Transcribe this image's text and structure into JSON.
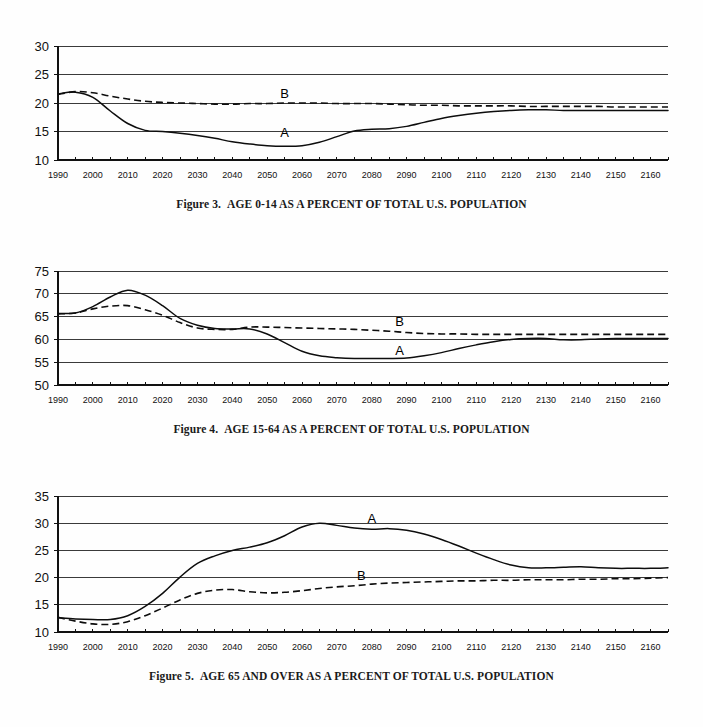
{
  "document": {
    "kind": "figure-page",
    "background_color": "#fefefe",
    "ink_color": "#0d0d0d"
  },
  "figures": [
    {
      "id": "figure-3",
      "caption_number": "Figure 3.",
      "caption_text": "AGE 0-14 AS A PERCENT OF TOTAL U.S. POPULATION",
      "series_labels": [
        {
          "name": "A",
          "x": 2055,
          "y": 14.1
        },
        {
          "name": "B",
          "x": 2055,
          "y": 20.9
        }
      ]
    },
    {
      "id": "figure-4",
      "caption_number": "Figure 4.",
      "caption_text": "AGE 15-64 AS A PERCENT OF TOTAL U.S. POPULATION",
      "series_labels": [
        {
          "name": "A",
          "x": 2088,
          "y": 56.6
        },
        {
          "name": "B",
          "x": 2088,
          "y": 62.9
        }
      ]
    },
    {
      "id": "figure-5",
      "caption_number": "Figure 5.",
      "caption_text": "AGE 65 AND OVER AS A PERCENT OF TOTAL U.S. POPULATION",
      "series_labels": [
        {
          "name": "A",
          "x": 2080,
          "y": 30.0
        },
        {
          "name": "B",
          "x": 2077,
          "y": 19.6
        }
      ]
    }
  ],
  "chart_data": [
    {
      "type": "line",
      "title": "Figure 3.  AGE 0-14 AS A PERCENT OF TOTAL U.S. POPULATION",
      "xlabel": "",
      "ylabel": "",
      "xlim": [
        1990,
        2165
      ],
      "ylim": [
        10,
        30
      ],
      "yticks": [
        10,
        15,
        20,
        25,
        30
      ],
      "xticks": [
        1990,
        2000,
        2010,
        2020,
        2030,
        2040,
        2050,
        2060,
        2070,
        2080,
        2090,
        2100,
        2110,
        2120,
        2130,
        2140,
        2150,
        2160
      ],
      "xtick_minor_step": 5,
      "grid": true,
      "legend": "inline-labels",
      "series": [
        {
          "name": "A",
          "style": "solid",
          "x": [
            1990,
            1995,
            2000,
            2005,
            2010,
            2015,
            2020,
            2025,
            2030,
            2035,
            2040,
            2045,
            2050,
            2055,
            2060,
            2065,
            2070,
            2075,
            2080,
            2085,
            2090,
            2095,
            2100,
            2105,
            2110,
            2115,
            2120,
            2125,
            2130,
            2135,
            2140,
            2145,
            2150,
            2155,
            2160,
            2165
          ],
          "values": [
            21.6,
            21.9,
            21.0,
            18.6,
            16.4,
            15.2,
            15.0,
            14.7,
            14.3,
            13.8,
            13.2,
            12.8,
            12.5,
            12.4,
            12.5,
            13.1,
            14.1,
            15.1,
            15.4,
            15.5,
            15.9,
            16.6,
            17.3,
            17.8,
            18.2,
            18.5,
            18.7,
            18.8,
            18.8,
            18.7,
            18.7,
            18.7,
            18.7,
            18.7,
            18.7,
            18.7
          ]
        },
        {
          "name": "B",
          "style": "dashed",
          "x": [
            1990,
            1995,
            2000,
            2005,
            2010,
            2015,
            2020,
            2025,
            2030,
            2035,
            2040,
            2045,
            2050,
            2055,
            2060,
            2065,
            2070,
            2075,
            2080,
            2085,
            2090,
            2095,
            2100,
            2105,
            2110,
            2115,
            2120,
            2125,
            2130,
            2135,
            2140,
            2145,
            2150,
            2155,
            2160,
            2165
          ],
          "values": [
            21.5,
            22.0,
            21.8,
            21.2,
            20.7,
            20.3,
            20.1,
            20.0,
            19.9,
            19.8,
            19.8,
            19.9,
            19.9,
            20.0,
            20.0,
            20.0,
            19.9,
            19.9,
            19.9,
            19.8,
            19.7,
            19.6,
            19.6,
            19.5,
            19.5,
            19.5,
            19.5,
            19.4,
            19.4,
            19.4,
            19.4,
            19.4,
            19.3,
            19.3,
            19.3,
            19.3
          ]
        }
      ]
    },
    {
      "type": "line",
      "title": "Figure 4.  AGE 15-64 AS A PERCENT OF TOTAL U.S. POPULATION",
      "xlabel": "",
      "ylabel": "",
      "xlim": [
        1990,
        2165
      ],
      "ylim": [
        50,
        75
      ],
      "yticks": [
        50,
        55,
        60,
        65,
        70,
        75
      ],
      "xticks": [
        1990,
        2000,
        2010,
        2020,
        2030,
        2040,
        2050,
        2060,
        2070,
        2080,
        2090,
        2100,
        2110,
        2120,
        2130,
        2140,
        2150,
        2160
      ],
      "xtick_minor_step": 5,
      "grid": true,
      "legend": "inline-labels",
      "series": [
        {
          "name": "A",
          "style": "solid",
          "x": [
            1990,
            1995,
            2000,
            2005,
            2010,
            2015,
            2020,
            2025,
            2030,
            2035,
            2040,
            2045,
            2050,
            2055,
            2060,
            2065,
            2070,
            2075,
            2080,
            2085,
            2090,
            2095,
            2100,
            2105,
            2110,
            2115,
            2120,
            2125,
            2130,
            2135,
            2140,
            2145,
            2150,
            2155,
            2160,
            2165
          ],
          "values": [
            65.7,
            65.8,
            67.2,
            69.3,
            70.8,
            69.7,
            67.4,
            64.6,
            63.1,
            62.4,
            62.3,
            62.3,
            61.2,
            59.3,
            57.4,
            56.4,
            56.0,
            55.8,
            55.8,
            55.8,
            55.9,
            56.4,
            57.1,
            58.0,
            58.8,
            59.5,
            60.0,
            60.2,
            60.2,
            59.9,
            59.9,
            60.1,
            60.2,
            60.2,
            60.2,
            60.2
          ]
        },
        {
          "name": "B",
          "style": "dashed",
          "x": [
            1990,
            1995,
            2000,
            2005,
            2010,
            2015,
            2020,
            2025,
            2030,
            2035,
            2040,
            2045,
            2050,
            2055,
            2060,
            2065,
            2070,
            2075,
            2080,
            2085,
            2090,
            2095,
            2100,
            2105,
            2110,
            2115,
            2120,
            2125,
            2130,
            2135,
            2140,
            2145,
            2150,
            2155,
            2160,
            2165
          ],
          "values": [
            65.6,
            65.8,
            66.7,
            67.3,
            67.4,
            66.5,
            65.3,
            63.7,
            62.5,
            62.2,
            62.2,
            62.7,
            62.7,
            62.6,
            62.5,
            62.4,
            62.3,
            62.2,
            62.0,
            61.8,
            61.5,
            61.3,
            61.2,
            61.2,
            61.1,
            61.1,
            61.1,
            61.1,
            61.1,
            61.1,
            61.1,
            61.1,
            61.1,
            61.1,
            61.1,
            61.1
          ]
        }
      ]
    },
    {
      "type": "line",
      "title": "Figure 5.  AGE 65 AND OVER AS A PERCENT OF TOTAL U.S. POPULATION",
      "xlabel": "",
      "ylabel": "",
      "xlim": [
        1990,
        2165
      ],
      "ylim": [
        10,
        35
      ],
      "yticks": [
        10,
        15,
        20,
        25,
        30,
        35
      ],
      "xticks": [
        1990,
        2000,
        2010,
        2020,
        2030,
        2040,
        2050,
        2060,
        2070,
        2080,
        2090,
        2100,
        2110,
        2120,
        2130,
        2140,
        2150,
        2160
      ],
      "xtick_minor_step": 5,
      "grid": true,
      "legend": "inline-labels",
      "series": [
        {
          "name": "A",
          "style": "solid",
          "x": [
            1990,
            1995,
            2000,
            2005,
            2010,
            2015,
            2020,
            2025,
            2030,
            2035,
            2040,
            2045,
            2050,
            2055,
            2060,
            2065,
            2070,
            2075,
            2080,
            2085,
            2090,
            2095,
            2100,
            2105,
            2110,
            2115,
            2120,
            2125,
            2130,
            2135,
            2140,
            2145,
            2150,
            2155,
            2160,
            2165
          ],
          "values": [
            12.6,
            12.4,
            12.3,
            12.3,
            13.0,
            14.7,
            17.1,
            20.1,
            22.6,
            24.0,
            25.0,
            25.6,
            26.4,
            27.7,
            29.3,
            30.0,
            29.6,
            29.1,
            28.9,
            29.0,
            28.7,
            28.0,
            27.0,
            25.8,
            24.5,
            23.3,
            22.3,
            21.8,
            21.8,
            21.9,
            22.0,
            21.8,
            21.7,
            21.7,
            21.7,
            21.8
          ]
        },
        {
          "name": "B",
          "style": "dashed",
          "x": [
            1990,
            1995,
            2000,
            2005,
            2010,
            2015,
            2020,
            2025,
            2030,
            2035,
            2040,
            2045,
            2050,
            2055,
            2060,
            2065,
            2070,
            2075,
            2080,
            2085,
            2090,
            2095,
            2100,
            2105,
            2110,
            2115,
            2120,
            2125,
            2130,
            2135,
            2140,
            2145,
            2150,
            2155,
            2160,
            2165
          ],
          "values": [
            12.7,
            12.0,
            11.5,
            11.4,
            11.9,
            13.0,
            14.4,
            15.9,
            17.1,
            17.7,
            17.8,
            17.4,
            17.2,
            17.3,
            17.6,
            18.0,
            18.3,
            18.5,
            18.8,
            19.0,
            19.1,
            19.2,
            19.3,
            19.4,
            19.4,
            19.5,
            19.5,
            19.6,
            19.6,
            19.6,
            19.7,
            19.7,
            19.8,
            19.8,
            19.9,
            20.0
          ]
        }
      ]
    }
  ]
}
